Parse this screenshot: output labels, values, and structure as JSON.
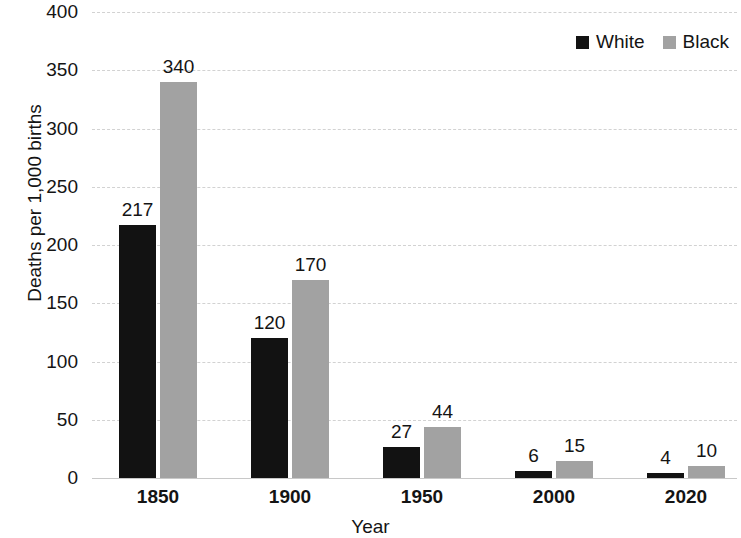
{
  "chart_data": {
    "type": "bar",
    "title": "",
    "subtitle": "",
    "xlabel": "Year",
    "ylabel": "Deaths per 1,000 births",
    "categories": [
      "1850",
      "1900",
      "1950",
      "2000",
      "2020"
    ],
    "series": [
      {
        "name": "White",
        "color": "#121212",
        "values": [
          217,
          120,
          27,
          6,
          4
        ]
      },
      {
        "name": "Black",
        "color": "#a2a2a2",
        "values": [
          340,
          170,
          44,
          15,
          10
        ]
      }
    ],
    "ylim": [
      0,
      400
    ],
    "ytick_step": 50,
    "ytick_labels": [
      "0",
      "50",
      "100",
      "150",
      "200",
      "250",
      "300",
      "350",
      "400"
    ],
    "ytick_values": [
      0,
      50,
      100,
      150,
      200,
      250,
      300,
      350,
      400
    ],
    "grid": true,
    "grid_style": "dashed",
    "grid_color": "#d2d2d2",
    "legend_position": "top-right",
    "data_labels": true,
    "data_labels_text": [
      [
        "217",
        "340"
      ],
      [
        "120",
        "170"
      ],
      [
        "27",
        "44"
      ],
      [
        "6",
        "15"
      ],
      [
        "4",
        "10"
      ]
    ],
    "background_color": "#ffffff",
    "text_color": "#141414"
  }
}
